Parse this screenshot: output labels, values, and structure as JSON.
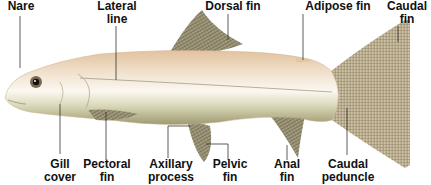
{
  "diagram": {
    "colors": {
      "background": "#ffffff",
      "body_top": "#e6c9a8",
      "body_mid": "#f4ece0",
      "body_belly": "#b7b48a",
      "fin": "#8c866a",
      "fin_stripe": "#5f5a45",
      "leader_line": "#333333",
      "label_text": "#111111"
    },
    "labels": {
      "nare": {
        "line1": "Nare",
        "line2": ""
      },
      "lateral_line": {
        "line1": "Lateral",
        "line2": "line"
      },
      "dorsal_fin": {
        "line1": "Dorsal fin",
        "line2": ""
      },
      "adipose_fin": {
        "line1": "Adipose fin",
        "line2": ""
      },
      "caudal_fin": {
        "line1": "Caudal",
        "line2": "fin"
      },
      "gill_cover": {
        "line1": "Gill",
        "line2": "cover"
      },
      "pectoral_fin": {
        "line1": "Pectoral",
        "line2": "fin"
      },
      "axillary_process": {
        "line1": "Axillary",
        "line2": "process"
      },
      "pelvic_fin": {
        "line1": "Pelvic",
        "line2": "fin"
      },
      "anal_fin": {
        "line1": "Anal",
        "line2": "fin"
      },
      "caudal_peduncle": {
        "line1": "Caudal",
        "line2": "peduncle"
      }
    }
  }
}
